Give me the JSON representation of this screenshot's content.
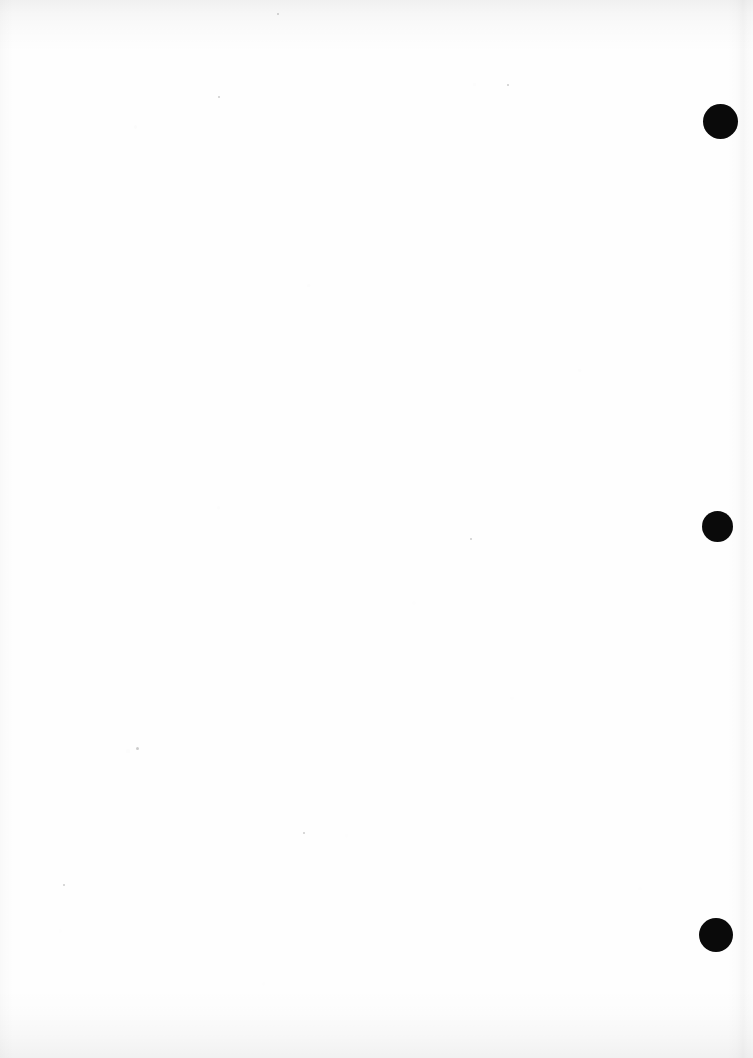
{
  "document": {
    "kind": "scanned-page",
    "title": "Scanned Blank Page",
    "page_width": 753,
    "page_height": 1058,
    "background_color": "#ffffff",
    "paper_color": "#fefefe",
    "body_text": "",
    "has_visible_text": false,
    "orientation": "portrait"
  },
  "marks": {
    "label": "punch marks",
    "color": "#0a0a0a",
    "count": 3,
    "items": [
      {
        "name": "punch-mark-top",
        "cx": 720,
        "cy": 121,
        "d": 35
      },
      {
        "name": "punch-mark-middle",
        "cx": 717,
        "cy": 526,
        "d": 31
      },
      {
        "name": "punch-mark-bottom",
        "cx": 716,
        "cy": 935,
        "d": 34
      }
    ]
  },
  "specks": {
    "label": "scanner specks",
    "items": [
      {
        "x": 136,
        "y": 747,
        "d": 3
      },
      {
        "x": 470,
        "y": 538,
        "d": 2
      },
      {
        "x": 303,
        "y": 832,
        "d": 2
      },
      {
        "x": 277,
        "y": 13,
        "d": 2
      },
      {
        "x": 63,
        "y": 884,
        "d": 2
      },
      {
        "x": 218,
        "y": 96,
        "d": 2
      },
      {
        "x": 507,
        "y": 84,
        "d": 2
      }
    ]
  },
  "edges": {
    "top_shadow": true,
    "bottom_shadow": true,
    "right_shadow": true,
    "left_shadow": true
  }
}
